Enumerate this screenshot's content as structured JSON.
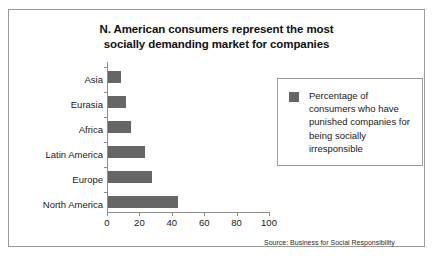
{
  "chart_data": {
    "type": "bar",
    "orientation": "horizontal",
    "title": "N. American consumers represent the most socially demanding market for companies",
    "title_lines": [
      "N. American consumers represent the most",
      "socially demanding market for companies"
    ],
    "categories": [
      "Asia",
      "Eurasia",
      "Africa",
      "Latin America",
      "Europe",
      "North America"
    ],
    "values": [
      8,
      11,
      14,
      23,
      27,
      43
    ],
    "series": [
      {
        "name": "Percentage of consumers who have punished companies for being socially irresponsible",
        "values": [
          8,
          11,
          14,
          23,
          27,
          43
        ]
      }
    ],
    "xlabel": "",
    "ylabel": "",
    "xlim": [
      0,
      100
    ],
    "xticks": [
      0,
      20,
      40,
      60,
      80,
      100
    ],
    "xtick_labels": [
      "0",
      "20",
      "40",
      "60",
      "80",
      "100"
    ],
    "grid": false,
    "legend_position": "right",
    "bar_color": "#666666",
    "axis_color": "#8d8d8d",
    "frame_color": "#9a9a9a",
    "background_color": "#ffffff"
  },
  "legend": {
    "swatch_color": "#666666",
    "label": "Percentage of consumers who have punished companies for being socially irresponsible"
  },
  "source": {
    "text": "Source: Business for Social Responsibility"
  }
}
